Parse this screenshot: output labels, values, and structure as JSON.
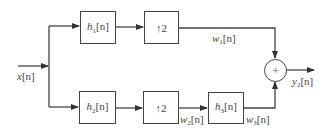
{
  "diagram": {
    "type": "block-diagram",
    "input": {
      "label": "x",
      "arg": "[n]"
    },
    "output": {
      "label": "y",
      "sub": "2",
      "arg": "[n]"
    },
    "top_branch": {
      "filter": {
        "label": "h",
        "sub": "1",
        "arg": "[n]"
      },
      "upsampler": {
        "arrow": "↑",
        "factor": "2"
      },
      "signal": {
        "label": "w",
        "sub": "1",
        "arg": "[n]"
      }
    },
    "bottom_branch": {
      "filter": {
        "label": "h",
        "sub": "2",
        "arg": "[n]"
      },
      "upsampler": {
        "arrow": "↑",
        "factor": "2"
      },
      "signal_after_upsampler": {
        "label": "w",
        "sub": "2",
        "arg": "[n]"
      },
      "filter2": {
        "label": "h",
        "sub": "3",
        "arg": "[n]"
      },
      "signal_after_filter2": {
        "label": "w",
        "sub": "3",
        "arg": "[n]"
      }
    },
    "adder": {
      "symbol": "+"
    },
    "colors": {
      "line": "#444444",
      "background": "#ffffff"
    }
  }
}
